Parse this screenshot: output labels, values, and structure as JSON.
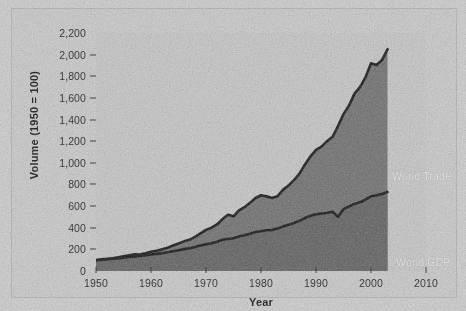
{
  "chart_data": {
    "type": "area",
    "title": "",
    "xlabel": "Year",
    "ylabel": "Volume (1950 = 100)",
    "xlim": [
      1950,
      2010
    ],
    "ylim": [
      0,
      2200
    ],
    "grid": false,
    "legend_position": "inline-annotations",
    "x_ticklabels": [
      "1950",
      "1960",
      "1970",
      "1980",
      "1990",
      "2000",
      "2010"
    ],
    "x_tickvalues": [
      1950,
      1960,
      1970,
      1980,
      1990,
      2000,
      2010
    ],
    "y_ticklabels": [
      "0",
      "200",
      "400",
      "600",
      "800",
      "1,000",
      "1,200",
      "1,400",
      "1,600",
      "1,800",
      "2,000",
      "2,200"
    ],
    "y_tickvalues": [
      0,
      200,
      400,
      600,
      800,
      1000,
      1200,
      1400,
      1600,
      1800,
      2000,
      2200
    ],
    "x": [
      1950,
      1951,
      1952,
      1953,
      1954,
      1955,
      1956,
      1957,
      1958,
      1959,
      1960,
      1961,
      1962,
      1963,
      1964,
      1965,
      1966,
      1967,
      1968,
      1969,
      1970,
      1971,
      1972,
      1973,
      1974,
      1975,
      1976,
      1977,
      1978,
      1979,
      1980,
      1981,
      1982,
      1983,
      1984,
      1985,
      1986,
      1987,
      1988,
      1989,
      1990,
      1991,
      1992,
      1993,
      1994,
      1995,
      1996,
      1997,
      1998,
      1999,
      2000,
      2001,
      2002,
      2003
    ],
    "series": [
      {
        "name": "World Trade",
        "annotation": "World Trade",
        "values": [
          100,
          108,
          112,
          118,
          126,
          136,
          146,
          154,
          152,
          164,
          178,
          188,
          200,
          214,
          236,
          254,
          274,
          288,
          316,
          348,
          380,
          400,
          430,
          480,
          520,
          505,
          560,
          590,
          630,
          675,
          700,
          690,
          675,
          690,
          750,
          790,
          840,
          900,
          985,
          1060,
          1120,
          1150,
          1200,
          1240,
          1340,
          1450,
          1530,
          1640,
          1700,
          1790,
          1920,
          1905,
          1950,
          2050
        ]
      },
      {
        "name": "World GDP",
        "annotation": "World GDP",
        "values": [
          100,
          104,
          108,
          113,
          117,
          124,
          130,
          135,
          138,
          145,
          152,
          158,
          165,
          173,
          183,
          192,
          202,
          210,
          222,
          235,
          246,
          256,
          270,
          288,
          296,
          302,
          318,
          330,
          345,
          360,
          368,
          376,
          380,
          392,
          412,
          428,
          444,
          464,
          490,
          510,
          524,
          530,
          538,
          548,
          500,
          572,
          596,
          620,
          636,
          660,
          690,
          700,
          712,
          730
        ]
      }
    ]
  }
}
